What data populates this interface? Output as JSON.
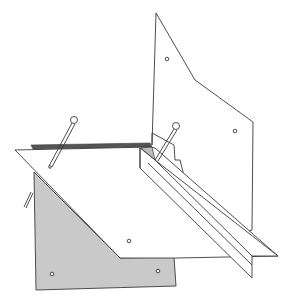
{
  "illustration": {
    "description": "Line drawing of folded/pinned paper sheets with an angled channel strip",
    "colors": {
      "stroke": "#3a3a3a",
      "background": "#ffffff",
      "shaded_sheet": "#c9c9c9"
    },
    "elements": {
      "back_sheet": "upright white sheet with two holes",
      "shaded_sheet": "gray sheet with two holes",
      "front_sheet": "white diagonal sheet with one hole",
      "channel_strip": "long angled folded strip",
      "pins": 3
    }
  }
}
